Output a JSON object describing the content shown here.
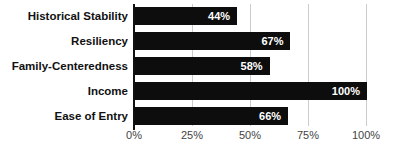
{
  "chart_data": {
    "type": "bar",
    "orientation": "horizontal",
    "title": "",
    "categories": [
      "Historical Stability",
      "Resiliency",
      "Family-Centeredness",
      "Income",
      "Ease of Entry"
    ],
    "values": [
      44,
      67,
      58,
      100,
      66
    ],
    "value_labels": [
      "44%",
      "67%",
      "58%",
      "100%",
      "66%"
    ],
    "x_ticks": [
      {
        "value": 0,
        "label": "0%"
      },
      {
        "value": 25,
        "label": "25%"
      },
      {
        "value": 50,
        "label": "50%"
      },
      {
        "value": 75,
        "label": "75%"
      },
      {
        "value": 100,
        "label": "100%"
      }
    ],
    "xlim": [
      0,
      100
    ],
    "grid": true,
    "legend": "none",
    "colors": {
      "bar": "#0d0d0d",
      "value_label": "#ffffff",
      "gridline": "#cccccc",
      "axis_line": "#111111",
      "tick_label": "#444444",
      "category_label": "#111111",
      "background": "#ffffff"
    }
  }
}
